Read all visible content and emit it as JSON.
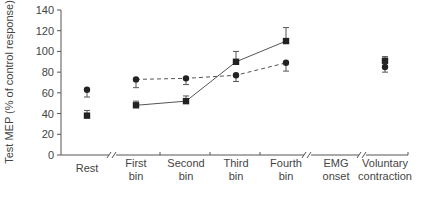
{
  "chart_data": {
    "type": "line",
    "title": "",
    "xlabel": "",
    "ylabel": "Test MEP (% of control response)",
    "ylim": [
      0,
      140
    ],
    "yticks": [
      0,
      20,
      40,
      60,
      80,
      100,
      120,
      140
    ],
    "grid": false,
    "legend": null,
    "categories": [
      "Rest",
      "First bin",
      "Second bin",
      "Third bin",
      "Fourth bin",
      "EMG onset",
      "Voluntary contraction"
    ],
    "category_lines": [
      [
        "Rest"
      ],
      [
        "First",
        "bin"
      ],
      [
        "Second",
        "bin"
      ],
      [
        "Third",
        "bin"
      ],
      [
        "Fourth",
        "bin"
      ],
      [
        "EMG",
        "onset"
      ],
      [
        "Voluntary",
        "contraction"
      ]
    ],
    "axis_breaks_after": [
      "Rest",
      "Fourth bin",
      "EMG onset"
    ],
    "series": [
      {
        "name": "circle (dashed)",
        "marker": "circle",
        "line": "dashed",
        "connected_categories": [
          "First bin",
          "Second bin",
          "Third bin",
          "Fourth bin"
        ],
        "values": [
          63,
          73,
          74,
          77,
          89,
          null,
          85
        ],
        "errors": [
          7,
          8,
          6,
          6,
          8,
          null,
          5
        ],
        "error_direction": "down"
      },
      {
        "name": "square (solid)",
        "marker": "square",
        "line": "solid",
        "connected_categories": [
          "First bin",
          "Second bin",
          "Third bin",
          "Fourth bin"
        ],
        "values": [
          38,
          48,
          52,
          90,
          110,
          null,
          91
        ],
        "errors": [
          5,
          4,
          5,
          10,
          13,
          null,
          4
        ],
        "error_direction": "up"
      }
    ]
  },
  "colors": {
    "axis": "#555555",
    "marker": "#222222",
    "line": "#555555",
    "text": "#444444"
  }
}
